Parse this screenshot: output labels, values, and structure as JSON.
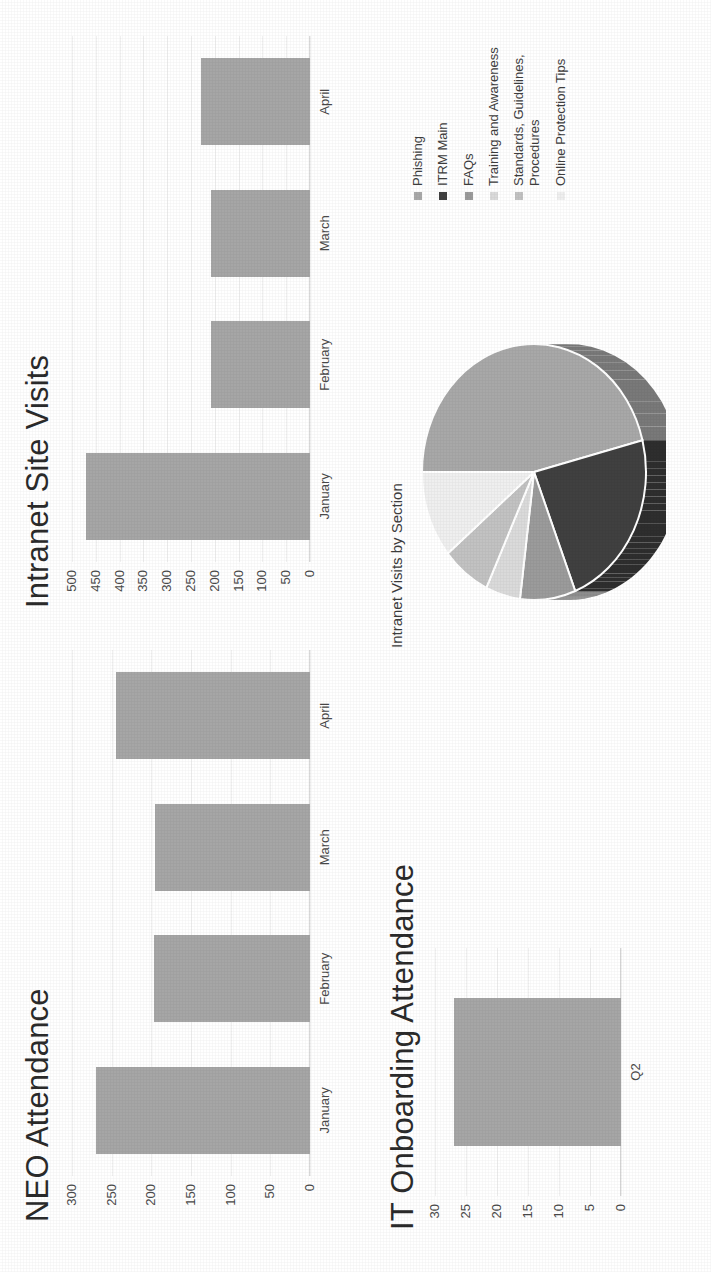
{
  "page": {
    "orientation": "rotated-90-ccw",
    "background": "#ffffff"
  },
  "colors": {
    "bar": "#a6a6a6",
    "text": "#3a3a3a",
    "grid": "#f0f0f0",
    "axis": "#d9d9d9",
    "pie": [
      "#a6a6a6",
      "#3f3f3f",
      "#8c8c8c",
      "#595959",
      "#d9d9d9",
      "#bfbfbf",
      "#f2f2f2",
      "#737373"
    ]
  },
  "charts": {
    "neo_attendance": {
      "title": "NEO Attendance",
      "chart_data": {
        "type": "bar",
        "title": "NEO Attendance",
        "categories": [
          "January",
          "February",
          "March",
          "April"
        ],
        "values": [
          270,
          197,
          195,
          245
        ],
        "xlabel": "",
        "ylabel": "",
        "ylim": [
          0,
          300
        ],
        "yticks": [
          0,
          50,
          100,
          150,
          200,
          250,
          300
        ],
        "ytick_labels": [
          "0",
          "50",
          "100",
          "150",
          "200",
          "250",
          "300"
        ],
        "grid": true,
        "legend": false,
        "orientation": "vertical"
      }
    },
    "intranet_site_visits": {
      "title": "Intranet Site Visits",
      "chart_data": {
        "type": "bar",
        "title": "Intranet Site Visits",
        "categories": [
          "January",
          "February",
          "March",
          "April"
        ],
        "values": [
          470,
          208,
          208,
          228
        ],
        "xlabel": "",
        "ylabel": "",
        "ylim": [
          0,
          500
        ],
        "yticks": [
          0,
          50,
          100,
          150,
          200,
          250,
          300,
          350,
          400,
          450,
          500
        ],
        "ytick_labels": [
          "0",
          "50",
          "100",
          "150",
          "200",
          "250",
          "300",
          "350",
          "400",
          "450",
          "500"
        ],
        "grid": true,
        "legend": false,
        "orientation": "vertical"
      }
    },
    "it_onboarding_attendance": {
      "title": "IT Onboarding Attendance",
      "chart_data": {
        "type": "bar",
        "title": "IT Onboarding Attendance",
        "categories": [
          "Q2"
        ],
        "values": [
          27
        ],
        "xlabel": "",
        "ylabel": "",
        "ylim": [
          0,
          30
        ],
        "yticks": [
          0,
          5,
          10,
          15,
          20,
          25,
          30
        ],
        "ytick_labels": [
          "0",
          "5",
          "10",
          "15",
          "20",
          "25",
          "30"
        ],
        "grid": true,
        "legend": false,
        "orientation": "vertical"
      }
    },
    "intranet_visits_by_section": {
      "title": "Intranet Visits by Section",
      "chart_data": {
        "type": "pie",
        "title": "Intranet Visits by Section",
        "style": "3d-pie",
        "legend_position": "right",
        "labels": [
          "Phishing",
          "ITRM Main",
          "FAQs",
          "Training and Awareness",
          "Standards, Guidelines,\nProcedures",
          "Online Protection Tips"
        ],
        "values": [
          46,
          23,
          8,
          5,
          7,
          11
        ],
        "colors": [
          "#a8a8a8",
          "#404040",
          "#9b9b9b",
          "#dadada",
          "#c2c2c2",
          "#efefef"
        ],
        "percentages": [
          "46%",
          "23%",
          "8%",
          "5%",
          "7%",
          "11%"
        ]
      }
    }
  }
}
